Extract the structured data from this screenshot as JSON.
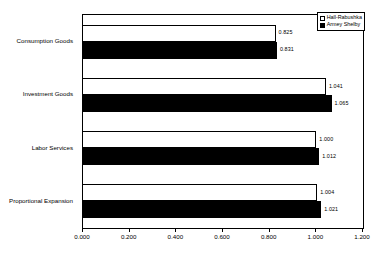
{
  "chart_data": {
    "type": "bar",
    "orientation": "horizontal",
    "title": "",
    "xlabel": "",
    "ylabel": "",
    "xlim": [
      0.0,
      1.2
    ],
    "xticks": [
      "0.000",
      "0.200",
      "0.400",
      "0.600",
      "0.800",
      "1.000",
      "1.200"
    ],
    "xtick_values": [
      0.0,
      0.2,
      0.4,
      0.6,
      0.8,
      1.0,
      1.2
    ],
    "grid": false,
    "legend_position": "top-right",
    "categories": [
      "Consumption Goods",
      "Investment Goods",
      "Labor Services",
      "Proportional Expansion"
    ],
    "series": [
      {
        "name": "Hall-Rabushka",
        "color": "#ffffff",
        "values": [
          0.825,
          1.041,
          1.0,
          1.004
        ],
        "labels": [
          "0.825",
          "1.041",
          "1.000",
          "1.004"
        ]
      },
      {
        "name": "Armey Shelby",
        "color": "#000000",
        "values": [
          0.831,
          1.065,
          1.012,
          1.021
        ],
        "labels": [
          "0.831",
          "1.065",
          "1.012",
          "1.021"
        ]
      }
    ]
  },
  "legend": {
    "items": [
      {
        "label": "Hall-Rabushka"
      },
      {
        "label": "Armey Shelby"
      }
    ]
  }
}
